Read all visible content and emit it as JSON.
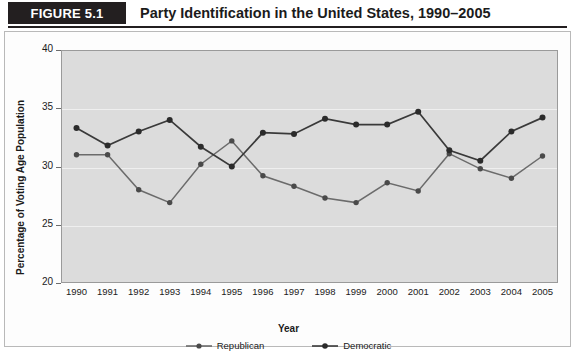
{
  "header": {
    "figure_tag": "FIGURE 5.1",
    "title": "Party Identification in the United States, 1990–2005"
  },
  "legend": {
    "republican": "Republican",
    "democratic": "Democratic"
  },
  "colors": {
    "republican": "#6b6b6b",
    "democratic": "#3a3a3a",
    "plot_background": "#dcdcdc",
    "header_tag_background": "#231f20"
  },
  "chart_data": {
    "type": "line",
    "title": "Party Identification in the United States, 1990–2005",
    "xlabel": "Year",
    "ylabel": "Percentage of Voting Age Population",
    "categories": [
      "1990",
      "1991",
      "1992",
      "1993",
      "1994",
      "1995",
      "1996",
      "1997",
      "1998",
      "1999",
      "2000",
      "2001",
      "2002",
      "2003",
      "2004",
      "2005"
    ],
    "x": [
      1990,
      1991,
      1992,
      1993,
      1994,
      1995,
      1996,
      1997,
      1998,
      1999,
      2000,
      2001,
      2002,
      2003,
      2004,
      2005
    ],
    "ylim": [
      20,
      40
    ],
    "yticks": [
      20,
      25,
      30,
      35,
      40
    ],
    "grid": true,
    "legend_position": "bottom",
    "series": [
      {
        "name": "Republican",
        "values": [
          31.0,
          31.0,
          28.0,
          26.9,
          30.2,
          32.2,
          29.2,
          28.3,
          27.3,
          26.9,
          28.6,
          27.9,
          31.1,
          29.8,
          29.0,
          30.9
        ]
      },
      {
        "name": "Democratic",
        "values": [
          33.3,
          31.8,
          33.0,
          34.0,
          31.7,
          30.0,
          32.9,
          32.8,
          34.1,
          33.6,
          33.6,
          34.7,
          31.4,
          30.5,
          33.0,
          34.2
        ]
      }
    ]
  }
}
